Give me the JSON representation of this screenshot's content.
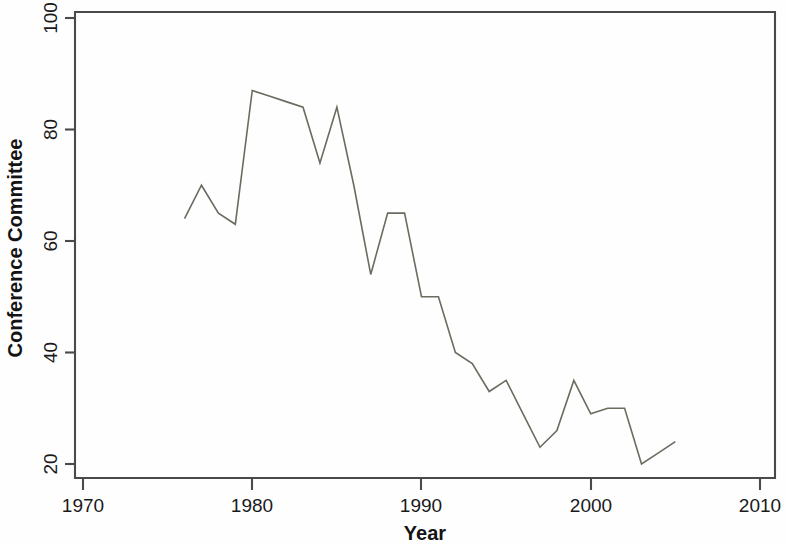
{
  "chart_data": {
    "type": "line",
    "title": "",
    "xlabel": "Year",
    "ylabel": "Conference Committee",
    "xlim": [
      1970,
      2010
    ],
    "ylim": [
      20,
      100
    ],
    "grid": false,
    "legend": null,
    "x_ticks": [
      1970,
      1980,
      1990,
      2000,
      2010
    ],
    "x_tick_labels": [
      "1970",
      "1980",
      "1990",
      "2000",
      "2010"
    ],
    "y_ticks": [
      20,
      40,
      60,
      80,
      100
    ],
    "y_tick_labels": [
      "20",
      "40",
      "60",
      "80",
      "100"
    ],
    "series": [
      {
        "name": "Conference Committee",
        "color": "#6b6b60",
        "x": [
          1976,
          1977,
          1978,
          1979,
          1980,
          1981,
          1982,
          1983,
          1984,
          1985,
          1986,
          1987,
          1988,
          1989,
          1990,
          1991,
          1992,
          1993,
          1994,
          1995,
          1996,
          1997,
          1998,
          1999,
          2000,
          2001,
          2002,
          2003,
          2004,
          2005
        ],
        "values": [
          64,
          70,
          65,
          63,
          87,
          86,
          85,
          84,
          74,
          84,
          70,
          54,
          65,
          65,
          50,
          50,
          40,
          38,
          33,
          35,
          29,
          23,
          26,
          35,
          29,
          30,
          30,
          20,
          22,
          24
        ]
      }
    ]
  },
  "axis": {
    "x_title": "Year",
    "y_title": "Conference Committee"
  }
}
